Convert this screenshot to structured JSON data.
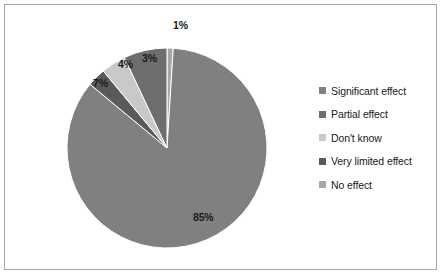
{
  "chart_data": {
    "type": "pie",
    "title": "",
    "categories": [
      "Significant effect",
      "Partial effect",
      "Don't know",
      "Very limited effect",
      "No effect"
    ],
    "values": [
      85,
      7,
      4,
      3,
      1
    ],
    "value_labels": [
      "85%",
      "7%",
      "4%",
      "3%",
      "1%"
    ],
    "units": "percent",
    "legend_position": "right",
    "grid": false,
    "slice_order_clockwise_from_top": [
      "No effect",
      "Significant effect",
      "Very limited effect",
      "Don't know",
      "Partial effect"
    ],
    "slice_colors": [
      "#808080",
      "#6e6e6e",
      "#c9c9c9",
      "#5a5a5a",
      "#a8a8a8"
    ],
    "colors": {
      "significant_effect": "#808080",
      "partial_effect": "#6e6e6e",
      "dont_know": "#c9c9c9",
      "very_limited_effect": "#5a5a5a",
      "no_effect": "#a8a8a8",
      "border": "#a6a6a6",
      "background": "#ffffff",
      "label_text": "#1a1a1a"
    }
  },
  "legend": {
    "items": [
      {
        "label": "Significant effect",
        "color": "#808080"
      },
      {
        "label": "Partial effect",
        "color": "#6e6e6e"
      },
      {
        "label": "Don't know",
        "color": "#c9c9c9"
      },
      {
        "label": "Very limited effect",
        "color": "#5a5a5a"
      },
      {
        "label": "No effect",
        "color": "#a8a8a8"
      }
    ]
  },
  "slice_labels": [
    {
      "text": "1%",
      "x": 168,
      "y": 14
    },
    {
      "text": "3%",
      "x": 137,
      "y": 47
    },
    {
      "text": "4%",
      "x": 113,
      "y": 53
    },
    {
      "text": "7%",
      "x": 88,
      "y": 72
    },
    {
      "text": "85%",
      "x": 188,
      "y": 206
    }
  ]
}
